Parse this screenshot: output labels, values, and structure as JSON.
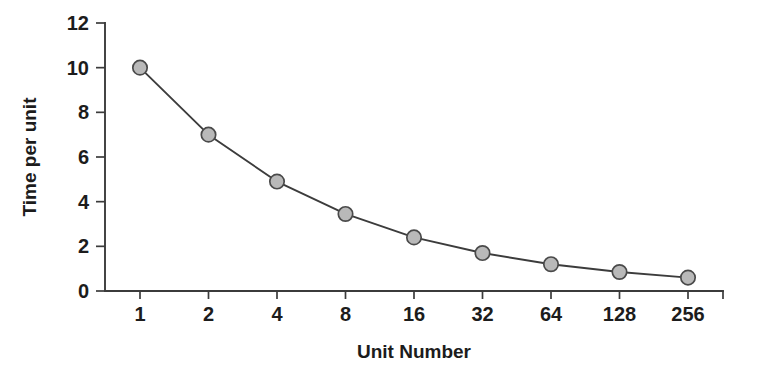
{
  "chart_data": {
    "type": "line",
    "title": "",
    "subtitle": "",
    "xlabel": "Unit Number",
    "ylabel": "Time per unit",
    "categories": [
      "1",
      "2",
      "4",
      "8",
      "16",
      "32",
      "64",
      "128",
      "256"
    ],
    "x": [
      1,
      2,
      4,
      8,
      16,
      32,
      64,
      128,
      256
    ],
    "values": [
      10.0,
      7.0,
      4.9,
      3.45,
      2.4,
      1.7,
      1.2,
      0.85,
      0.6
    ],
    "series": [
      {
        "name": "Time per unit",
        "values": [
          10.0,
          7.0,
          4.9,
          3.45,
          2.4,
          1.7,
          1.2,
          0.85,
          0.6
        ]
      }
    ],
    "ylim": [
      0,
      12
    ],
    "y_ticks": [
      0,
      2,
      4,
      6,
      8,
      10,
      12
    ],
    "y_tick_labels": [
      "0",
      "2",
      "4",
      "6",
      "8",
      "10",
      "12"
    ],
    "x_tick_labels": [
      "1",
      "2",
      "4",
      "8",
      "16",
      "32",
      "64",
      "128",
      "256"
    ],
    "x_scale": "log2-categorical",
    "grid": false,
    "legend": false,
    "legend_position": "none",
    "marker": "circle",
    "marker_fill_color": "#b9b9b9",
    "marker_edge_color": "#4a4a4a",
    "line_color": "#3c3c3c",
    "axis_color": "#3b3b3b",
    "background_color": "#ffffff",
    "annotations": []
  },
  "layout": {
    "plot_left": 105,
    "plot_right": 723,
    "plot_top": 23,
    "plot_bottom": 291,
    "first_tick_x": 140,
    "tick_spacing": 68.5,
    "marker_radius": 7.2,
    "y_tick_len": 9,
    "x_tick_len": 8
  }
}
